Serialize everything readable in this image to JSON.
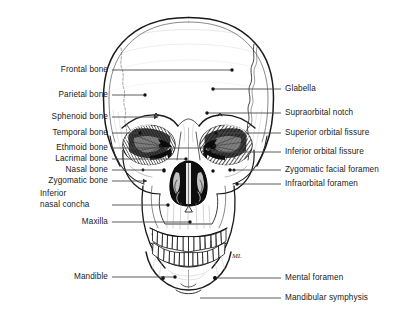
{
  "figure": {
    "background_color": "#ffffff",
    "line_color": "#4a4a4a",
    "text_color": "#1a1a1a",
    "width": 399,
    "height": 317
  },
  "labels_left": [
    {
      "id": "frontal-bone",
      "text": "Frontal bone",
      "text_x": 108,
      "text_y": 70,
      "line_x1": 112,
      "line_y1": 70,
      "line_x2": 232,
      "line_y2": 70,
      "dot": true,
      "elbow": false
    },
    {
      "id": "parietal-bone",
      "text": "Parietal bone",
      "text_x": 108,
      "text_y": 95,
      "line_x1": 112,
      "line_y1": 95,
      "line_x2": 145,
      "line_y2": 95,
      "dot": true,
      "elbow": false
    },
    {
      "id": "sphenoid-bone",
      "text": "Sphenoid bone",
      "text_x": 108,
      "text_y": 117,
      "line_x1": 112,
      "line_y1": 117,
      "line_x2": 158,
      "line_y2": 117,
      "dot": false,
      "elbow": false,
      "arrow": true
    },
    {
      "id": "temporal-bone",
      "text": "Temporal bone",
      "text_x": 108,
      "text_y": 133,
      "line_x1": 112,
      "line_y1": 133,
      "line_x2": 140,
      "line_y2": 133,
      "dot": true,
      "elbow": false
    },
    {
      "id": "ethmoid-bone",
      "text": "Ethmoid bone",
      "text_x": 108,
      "text_y": 148,
      "line_x1": 112,
      "line_y1": 148,
      "line_x2": 205,
      "line_y2": 148,
      "dot": true,
      "elbow": false
    },
    {
      "id": "lacrimal-bone",
      "text": "Lacrimal bone",
      "text_x": 108,
      "text_y": 159,
      "line_x1": 112,
      "line_y1": 159,
      "line_x2": 186,
      "line_y2": 159,
      "dot": true,
      "elbow": false
    },
    {
      "id": "nasal-bone",
      "text": "Nasal bone",
      "text_x": 108,
      "text_y": 170,
      "line_x1": 112,
      "line_y1": 170,
      "line_x2": 164,
      "line_y2": 170,
      "dot": true,
      "elbow": false
    },
    {
      "id": "zygomatic-bone",
      "text": "Zygomatic bone",
      "text_x": 108,
      "text_y": 181,
      "line_x1": 112,
      "line_y1": 181,
      "line_x2": 147,
      "line_y2": 181,
      "dot": false,
      "elbow": false,
      "arrow": true
    },
    {
      "id": "inferior-nasal-concha",
      "text": "Inferior\n nasal concha",
      "text_x": 108,
      "text_y": 199,
      "line_x1": 112,
      "line_y1": 205,
      "line_x2": 168,
      "line_y2": 205,
      "dot": true,
      "elbow": false,
      "two_line": true
    },
    {
      "id": "maxilla",
      "text": "Maxilla",
      "text_x": 108,
      "text_y": 222,
      "line_x1": 112,
      "line_y1": 222,
      "line_x2": 190,
      "line_y2": 222,
      "dot": true,
      "elbow": false
    },
    {
      "id": "mandible",
      "text": "Mandible",
      "text_x": 108,
      "text_y": 277,
      "line_x1": 112,
      "line_y1": 277,
      "line_x2": 175,
      "line_y2": 277,
      "dot": true,
      "elbow": false
    }
  ],
  "labels_right": [
    {
      "id": "glabella",
      "text": "Glabella",
      "text_x": 285,
      "text_y": 89,
      "line_x1": 281,
      "line_y1": 89,
      "line_x2": 213,
      "line_y2": 89,
      "dot": true
    },
    {
      "id": "supraorbital-notch",
      "text": "Supraorbital notch",
      "text_x": 285,
      "text_y": 113,
      "line_x1": 281,
      "line_y1": 113,
      "line_x2": 207,
      "line_y2": 113,
      "dot": true
    },
    {
      "id": "superior-orbital-fissure",
      "text": "Superior orbital fissure",
      "text_x": 285,
      "text_y": 133,
      "line_x1": 281,
      "line_y1": 133,
      "line_x2": 216,
      "line_y2": 133,
      "dot": true
    },
    {
      "id": "inferior-orbital-fissure",
      "text": "Inferior orbital fissure",
      "text_x": 285,
      "text_y": 152,
      "line_x1": 281,
      "line_y1": 152,
      "line_x2": 210,
      "line_y2": 152,
      "dot": true
    },
    {
      "id": "zygomatic-facial-foramen",
      "text": "Zygomatic facial foramen",
      "text_x": 285,
      "text_y": 170,
      "line_x1": 281,
      "line_y1": 170,
      "line_x2": 230,
      "line_y2": 170,
      "dot": true
    },
    {
      "id": "infraorbital-foramen",
      "text": "Infraorbital foramen",
      "text_x": 285,
      "text_y": 184,
      "line_x1": 281,
      "line_y1": 184,
      "line_x2": 237,
      "line_y2": 184,
      "dot": true
    },
    {
      "id": "mental-foramen",
      "text": "Mental foramen",
      "text_x": 285,
      "text_y": 278,
      "line_x1": 281,
      "line_y1": 278,
      "line_x2": 215,
      "line_y2": 278,
      "dot": true
    },
    {
      "id": "mandibular-symphysis",
      "text": "Mandibular symphysis",
      "text_x": 285,
      "text_y": 298,
      "line_x1": 281,
      "line_y1": 298,
      "line_x2": 200,
      "line_y2": 298,
      "dot": false
    }
  ],
  "artist_mark": "ML"
}
